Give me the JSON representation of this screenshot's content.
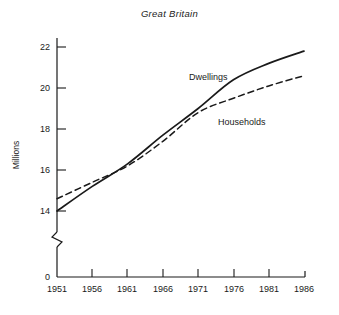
{
  "chart_data": {
    "type": "line",
    "title": "Great Britain",
    "xlabel": "",
    "ylabel": "Millions",
    "xlim": [
      1951,
      1986
    ],
    "ylim": [
      14,
      22
    ],
    "y_axis_break": true,
    "y_axis_break_note": "axis broken between 0 and 14",
    "grid": false,
    "legend_position": "inline-labels",
    "xticks": [
      "1951",
      "1956",
      "1961",
      "1966",
      "1971",
      "1976",
      "1981",
      "1986"
    ],
    "yticks": [
      "0",
      "14",
      "16",
      "18",
      "20",
      "22"
    ],
    "x": [
      1951,
      1956,
      1961,
      1966,
      1971,
      1976,
      1981,
      1986
    ],
    "series": [
      {
        "name": "Dwellings",
        "style": "solid",
        "values": [
          14.0,
          15.2,
          16.3,
          17.7,
          19.0,
          20.4,
          21.2,
          21.8
        ]
      },
      {
        "name": "Households",
        "style": "dashed",
        "values": [
          14.6,
          15.4,
          16.2,
          17.4,
          18.8,
          19.5,
          20.1,
          20.6
        ]
      }
    ],
    "annotations": [
      {
        "label": "Dwellings",
        "x": 1971,
        "y": 20.8
      },
      {
        "label": "Households",
        "x": 1976,
        "y": 18.4
      }
    ]
  },
  "axis": {
    "y_label": "Millions",
    "y_ticks": [
      {
        "label": "22"
      },
      {
        "label": "20"
      },
      {
        "label": "18"
      },
      {
        "label": "16"
      },
      {
        "label": "14"
      },
      {
        "label": "0"
      }
    ],
    "x_ticks": [
      {
        "label": "1951"
      },
      {
        "label": "1956"
      },
      {
        "label": "1961"
      },
      {
        "label": "1966"
      },
      {
        "label": "1971"
      },
      {
        "label": "1976"
      },
      {
        "label": "1981"
      },
      {
        "label": "1986"
      }
    ]
  },
  "series_labels": {
    "dwellings": "Dwellings",
    "households": "Households"
  },
  "title": "Great Britain",
  "colors": {
    "ink": "#1a1a1a",
    "background": "#ffffff"
  }
}
